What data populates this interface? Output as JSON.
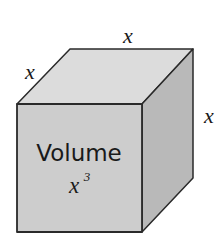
{
  "diagram": {
    "type": "cube",
    "colors": {
      "top_face": "#dcdcdc",
      "front_face": "#cdcdcd",
      "side_face": "#b9b9b9",
      "edge": "#2a2a2a",
      "text": "#1a1a1a"
    },
    "edge_labels": {
      "top": "x",
      "left": "x",
      "right": "x"
    },
    "face_label": {
      "title": "Volume",
      "formula_base": "x",
      "formula_exponent": "3"
    }
  }
}
